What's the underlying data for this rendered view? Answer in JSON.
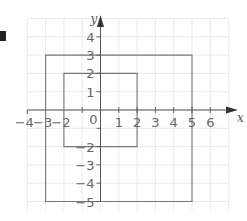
{
  "diagram": {
    "type": "coordinate-grid",
    "x_axis_label": "x",
    "y_axis_label": "y",
    "x_range": [
      -4,
      6
    ],
    "y_range": [
      -5,
      4
    ],
    "x_tick_labels": [
      "-4",
      "-3",
      "-2",
      "0",
      "1",
      "2",
      "3",
      "4",
      "5",
      "6"
    ],
    "y_tick_labels": [
      "4",
      "3",
      "2",
      "1",
      "-2",
      "-3",
      "-4",
      "-5"
    ],
    "origin_label": "0",
    "shapes": [
      {
        "name": "outer-rectangle",
        "corners": [
          [
            -3,
            3
          ],
          [
            5,
            3
          ],
          [
            5,
            -5
          ],
          [
            -3,
            -5
          ]
        ]
      },
      {
        "name": "inner-square",
        "corners": [
          [
            -2,
            2
          ],
          [
            2,
            2
          ],
          [
            2,
            -2
          ],
          [
            -2,
            -2
          ]
        ]
      }
    ],
    "colors": {
      "grid": "#e3e3e3",
      "axis": "#555555",
      "shapes": "#777777",
      "labels": "#666666"
    }
  }
}
